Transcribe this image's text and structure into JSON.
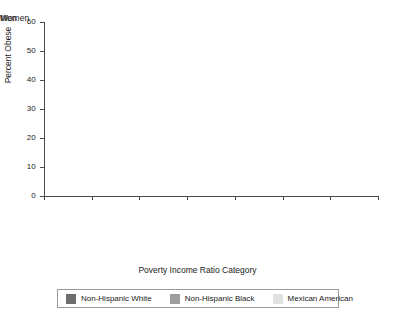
{
  "chart_data": {
    "type": "bar",
    "title": "",
    "xlabel": "Poverty Income Ratio Category",
    "ylabel": "Percent Obese",
    "ylim": [
      0,
      60
    ],
    "ytick_labels": [
      "0",
      "10",
      "20",
      "30",
      "40",
      "50",
      "60"
    ],
    "ytick_values": [
      0,
      10,
      20,
      30,
      40,
      50,
      60
    ],
    "grid": false,
    "legend_position": "bottom",
    "panels": [
      {
        "title": "Men",
        "categories": [
          "PIR < 130%",
          "130% ≤ PIR < 350%",
          "PIR ≥ 350%"
        ],
        "series": [
          {
            "name": "Non-Hispanic White",
            "values": [
              30,
              35,
              32
            ]
          },
          {
            "name": "Non-Hispanic Black",
            "values": [
              29,
              36,
              45
            ]
          },
          {
            "name": "Mexican American",
            "values": [
              30,
              31,
              41
            ]
          }
        ]
      },
      {
        "title": "Women",
        "categories": [
          "PIR < 130%",
          "130% ≤ PIR < 350%",
          "PIR ≥ 350%"
        ],
        "series": [
          {
            "name": "Non-Hispanic White",
            "values": [
              39,
              38,
              28
            ]
          },
          {
            "name": "Non-Hispanic Black",
            "values": [
              55,
              52,
              48
            ]
          },
          {
            "name": "Mexican American",
            "values": [
              45,
              46,
              35
            ]
          }
        ]
      }
    ],
    "series_colors": [
      "#6e6e6e",
      "#9d9d9d",
      "#e2e2e2"
    ],
    "legend": [
      {
        "label": "Non-Hispanic White",
        "color": "#6e6e6e"
      },
      {
        "label": "Non-Hispanic Black",
        "color": "#9d9d9d"
      },
      {
        "label": "Mexican American",
        "color": "#e2e2e2"
      }
    ]
  }
}
